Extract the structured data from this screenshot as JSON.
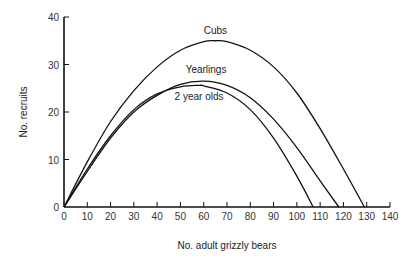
{
  "chart_data": {
    "type": "line",
    "title": "",
    "xlabel": "No. adult grizzly bears",
    "ylabel": "No. recruits",
    "xlim": [
      0,
      140
    ],
    "ylim": [
      0,
      40
    ],
    "xticks": [
      0,
      10,
      20,
      30,
      40,
      50,
      60,
      70,
      80,
      90,
      100,
      110,
      120,
      130,
      140
    ],
    "yticks": [
      0,
      10,
      20,
      30,
      40
    ],
    "grid": false,
    "legend": "inline labels on curves",
    "series": [
      {
        "name": "Cubs",
        "label_pos": {
          "x": 65,
          "y": 36.5
        },
        "x": [
          0,
          10,
          20,
          30,
          40,
          50,
          60,
          65,
          70,
          80,
          90,
          100,
          110,
          120,
          129
        ],
        "y": [
          0,
          9.5,
          18,
          24.5,
          29.5,
          33,
          34.8,
          35,
          34.8,
          33,
          29.5,
          24,
          16.5,
          8,
          0
        ]
      },
      {
        "name": "Yearlings",
        "label_pos": {
          "x": 61,
          "y": 28.3
        },
        "x": [
          0,
          10,
          20,
          30,
          40,
          50,
          60,
          70,
          80,
          90,
          100,
          110,
          118
        ],
        "y": [
          0,
          7.5,
          14.5,
          20,
          23.5,
          25.8,
          26.5,
          25.6,
          23,
          18.5,
          12.5,
          5.5,
          0
        ]
      },
      {
        "name": "2 year olds",
        "label_pos": {
          "x": 58,
          "y": 22.5
        },
        "x": [
          0,
          10,
          20,
          30,
          40,
          50,
          58,
          60,
          70,
          80,
          90,
          100,
          107
        ],
        "y": [
          0,
          8,
          15,
          20.5,
          23.8,
          25.3,
          25.6,
          25.5,
          24,
          20.5,
          14.5,
          6.5,
          0
        ]
      }
    ]
  }
}
